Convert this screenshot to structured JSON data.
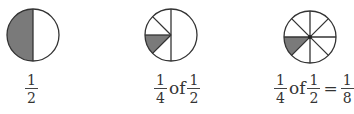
{
  "figures": [
    {
      "id": "half",
      "divisions": 2,
      "shaded_parts": [
        "left-half"
      ],
      "caption": {
        "parts": [
          {
            "type": "fraction",
            "num": "1",
            "den": "2"
          }
        ]
      }
    },
    {
      "id": "quarter-of-half",
      "divisions": "left half split into 4",
      "shaded_parts": [
        "left-lower-eighth"
      ],
      "caption": {
        "parts": [
          {
            "type": "fraction",
            "num": "1",
            "den": "4"
          },
          {
            "type": "word",
            "text": "of"
          },
          {
            "type": "fraction",
            "num": "1",
            "den": "2"
          }
        ]
      }
    },
    {
      "id": "eighth",
      "divisions": 8,
      "shaded_parts": [
        "left-lower-eighth"
      ],
      "caption": {
        "parts": [
          {
            "type": "fraction",
            "num": "1",
            "den": "4"
          },
          {
            "type": "word",
            "text": "of"
          },
          {
            "type": "fraction",
            "num": "1",
            "den": "2"
          },
          {
            "type": "equals",
            "text": "="
          },
          {
            "type": "fraction",
            "num": "1",
            "den": "8"
          }
        ]
      }
    }
  ],
  "colors": {
    "shade": "#7a7a7a",
    "stroke": "#333333",
    "background": "#ffffff"
  }
}
